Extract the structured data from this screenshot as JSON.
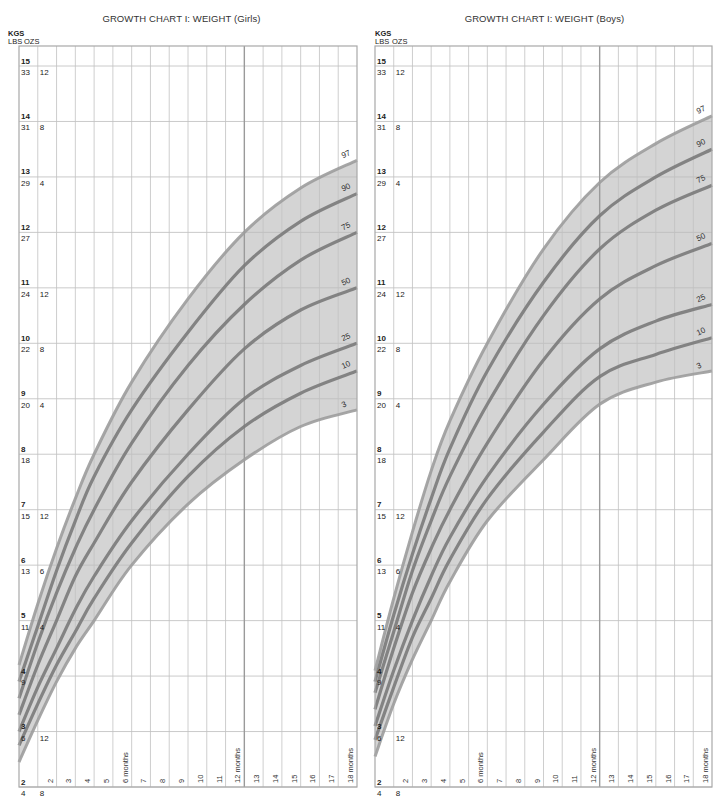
{
  "charts": [
    {
      "key": "girls",
      "title": "GROWTH CHART I: WEIGHT (Girls)",
      "units": {
        "kgs": "KGS",
        "lbs": "LBS",
        "ozs": "OZS"
      }
    },
    {
      "key": "boys",
      "title": "GROWTH CHART I: WEIGHT (Boys)",
      "units": {
        "kgs": "KGS",
        "lbs": "LBS",
        "ozs": "OZS"
      }
    }
  ],
  "y_axis": {
    "kg_ticks": [
      {
        "kg": "15",
        "lbs": "33",
        "ozs": "12"
      },
      {
        "kg": "14",
        "lbs": "31",
        "ozs": "8"
      },
      {
        "kg": "13",
        "lbs": "29",
        "ozs": "4"
      },
      {
        "kg": "12",
        "lbs": "27",
        "ozs": ""
      },
      {
        "kg": "11",
        "lbs": "24",
        "ozs": "12"
      },
      {
        "kg": "10",
        "lbs": "22",
        "ozs": "8"
      },
      {
        "kg": "9",
        "lbs": "20",
        "ozs": "4"
      },
      {
        "kg": "8",
        "lbs": "18",
        "ozs": ""
      },
      {
        "kg": "7",
        "lbs": "15",
        "ozs": "12"
      },
      {
        "kg": "6",
        "lbs": "13",
        "ozs": "6"
      },
      {
        "kg": "5",
        "lbs": "11",
        "ozs": "4"
      },
      {
        "kg": "4",
        "lbs": "9",
        "ozs": ""
      },
      {
        "kg": "3",
        "lbs": "6",
        "ozs": "12"
      },
      {
        "kg": "2",
        "lbs": "4",
        "ozs": "8"
      }
    ]
  },
  "x_axis": {
    "labels": [
      "2",
      "3",
      "4",
      "5",
      "6 months",
      "7",
      "8",
      "9",
      "10",
      "11",
      "12 months",
      "13",
      "14",
      "15",
      "16",
      "17",
      "18 months"
    ]
  },
  "bottom_text": "...  ..  ..  .  ...  .  .. . . .  .  ..           ..",
  "chart_data": [
    {
      "type": "line",
      "title": "GROWTH CHART I: WEIGHT (Girls)",
      "xlabel": "Age (months)",
      "ylabel": "Weight (KGS / LBS OZS)",
      "xlim": [
        0,
        18
      ],
      "ylim": [
        2,
        15
      ],
      "grid": true,
      "x": [
        0,
        1,
        2,
        3,
        4,
        6,
        9,
        12,
        15,
        18
      ],
      "series": [
        {
          "name": "97",
          "values": [
            4.2,
            5.3,
            6.3,
            7.2,
            8.0,
            9.3,
            10.8,
            12.0,
            12.8,
            13.3
          ]
        },
        {
          "name": "90",
          "values": [
            3.9,
            4.9,
            5.9,
            6.8,
            7.6,
            8.8,
            10.2,
            11.4,
            12.2,
            12.7
          ]
        },
        {
          "name": "75",
          "values": [
            3.6,
            4.6,
            5.5,
            6.3,
            7.0,
            8.2,
            9.6,
            10.7,
            11.5,
            12.0
          ]
        },
        {
          "name": "50",
          "values": [
            3.3,
            4.2,
            5.0,
            5.8,
            6.4,
            7.5,
            8.8,
            9.9,
            10.6,
            11.0
          ]
        },
        {
          "name": "25",
          "values": [
            3.0,
            3.8,
            4.5,
            5.2,
            5.8,
            6.8,
            8.0,
            9.0,
            9.6,
            10.0
          ]
        },
        {
          "name": "10",
          "values": [
            2.75,
            3.5,
            4.2,
            4.8,
            5.4,
            6.4,
            7.6,
            8.5,
            9.1,
            9.5
          ]
        },
        {
          "name": "3",
          "values": [
            2.45,
            3.2,
            3.9,
            4.5,
            5.0,
            6.0,
            7.1,
            7.9,
            8.5,
            8.8
          ]
        }
      ]
    },
    {
      "type": "line",
      "title": "GROWTH CHART I: WEIGHT (Boys)",
      "xlabel": "Age (months)",
      "ylabel": "Weight (KGS / LBS OZS)",
      "xlim": [
        0,
        18
      ],
      "ylim": [
        2,
        15
      ],
      "grid": true,
      "x": [
        0,
        1,
        2,
        3,
        4,
        6,
        9,
        12,
        15,
        18
      ],
      "series": [
        {
          "name": "97",
          "values": [
            4.1,
            5.4,
            6.6,
            7.7,
            8.6,
            10.0,
            11.7,
            12.9,
            13.6,
            14.1
          ]
        },
        {
          "name": "90",
          "values": [
            3.9,
            5.1,
            6.2,
            7.2,
            8.1,
            9.5,
            11.1,
            12.3,
            13.0,
            13.5
          ]
        },
        {
          "name": "75",
          "values": [
            3.7,
            4.8,
            5.9,
            6.8,
            7.6,
            8.9,
            10.5,
            11.7,
            12.4,
            12.85
          ]
        },
        {
          "name": "50",
          "values": [
            3.4,
            4.5,
            5.5,
            6.3,
            7.0,
            8.2,
            9.7,
            10.8,
            11.4,
            11.8
          ]
        },
        {
          "name": "25",
          "values": [
            3.1,
            4.1,
            5.0,
            5.8,
            6.5,
            7.6,
            8.9,
            9.9,
            10.4,
            10.7
          ]
        },
        {
          "name": "10",
          "values": [
            2.85,
            3.8,
            4.7,
            5.4,
            6.1,
            7.2,
            8.4,
            9.4,
            9.8,
            10.1
          ]
        },
        {
          "name": "3",
          "values": [
            2.55,
            3.5,
            4.3,
            5.0,
            5.7,
            6.8,
            7.9,
            8.9,
            9.3,
            9.5
          ]
        }
      ]
    }
  ]
}
